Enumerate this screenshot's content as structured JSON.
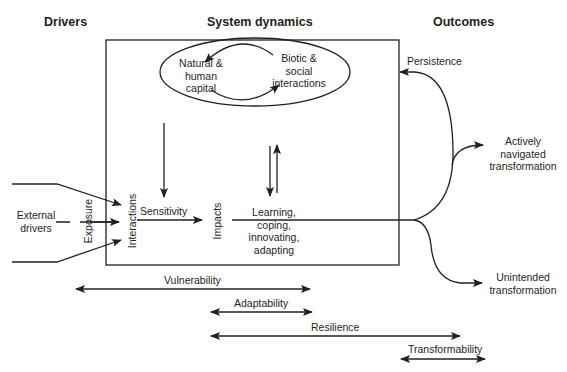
{
  "headers": {
    "drivers": "Drivers",
    "system_dynamics": "System dynamics",
    "outcomes": "Outcomes"
  },
  "nodes": {
    "external_drivers": [
      "External",
      "drivers"
    ],
    "exposure": "Exposure",
    "interactions": "Interactions",
    "sensitivity": "Sensitivity",
    "impacts": "Impacts",
    "natural_capital": [
      "Natural &",
      "human",
      "capital"
    ],
    "biotic_social": [
      "Biotic &",
      "social",
      "interactions"
    ],
    "learning": [
      "Learning,",
      "coping,",
      "innovating,",
      "adapting"
    ],
    "persistence": "Persistence",
    "actively_navigated": [
      "Actively",
      "navigated",
      "transformation"
    ],
    "unintended": [
      "Unintended",
      "transformation"
    ]
  },
  "ranges": {
    "vulnerability": "Vulnerability",
    "adaptability": "Adaptability",
    "resilience": "Resilience",
    "transformability": "Transformability"
  },
  "colors": {
    "stroke": "#231f20",
    "background": "#ffffff"
  }
}
